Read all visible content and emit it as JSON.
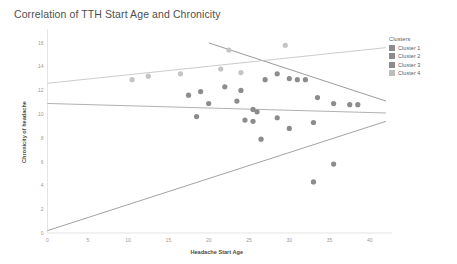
{
  "chart_data": {
    "type": "scatter",
    "title": "Correlation of TTH Start Age and Chronicity",
    "xlabel": "Headache Start Age",
    "ylabel": "Chronicity of headache",
    "xlim": [
      0,
      42
    ],
    "ylim": [
      0,
      17
    ],
    "xticks": [
      0,
      5,
      10,
      15,
      20,
      25,
      30,
      35,
      40
    ],
    "yticks": [
      0,
      2,
      4,
      6,
      8,
      10,
      12,
      14,
      16
    ],
    "grid": false,
    "legend": {
      "title": "Clusters",
      "position": "right",
      "entries": [
        {
          "label": "Cluster 1",
          "color": "#8c8c8c"
        },
        {
          "label": "Cluster 2",
          "color": "#8c8c8c"
        },
        {
          "label": "Cluster 3",
          "color": "#8c8c8c"
        },
        {
          "label": "Cluster 4",
          "color": "#bdbdbd"
        }
      ]
    },
    "series": [
      {
        "name": "Cluster 1",
        "color": "#8c8c8c",
        "points": [
          [
            17.5,
            11.6
          ],
          [
            19.0,
            11.9
          ],
          [
            20.0,
            10.9
          ],
          [
            22.0,
            12.3
          ],
          [
            23.5,
            11.1
          ],
          [
            24.0,
            12.0
          ],
          [
            25.5,
            10.4
          ],
          [
            26.0,
            10.2
          ],
          [
            27.0,
            12.9
          ],
          [
            28.5,
            13.4
          ],
          [
            30.0,
            13.0
          ],
          [
            31.0,
            12.9
          ],
          [
            32.0,
            12.9
          ],
          [
            33.5,
            11.4
          ],
          [
            35.5,
            10.9
          ],
          [
            37.5,
            10.8
          ],
          [
            38.5,
            10.8
          ]
        ]
      },
      {
        "name": "Cluster 2",
        "color": "#8c8c8c",
        "points": [
          [
            18.5,
            9.8
          ],
          [
            24.5,
            9.5
          ],
          [
            25.5,
            9.4
          ],
          [
            28.5,
            9.7
          ],
          [
            30.0,
            8.8
          ],
          [
            33.0,
            9.3
          ],
          [
            26.5,
            7.9
          ]
        ]
      },
      {
        "name": "Cluster 3",
        "color": "#8c8c8c",
        "points": [
          [
            33.0,
            4.3
          ],
          [
            35.5,
            5.8
          ]
        ]
      },
      {
        "name": "Cluster 4",
        "color": "#c4c4c4",
        "points": [
          [
            10.5,
            12.9
          ],
          [
            12.5,
            13.2
          ],
          [
            16.5,
            13.4
          ],
          [
            21.5,
            13.8
          ],
          [
            22.5,
            15.4
          ],
          [
            24.0,
            13.5
          ],
          [
            29.5,
            15.8
          ]
        ]
      }
    ],
    "trendlines": [
      {
        "name": "Cluster 1 trend",
        "color": "#6f6f6f",
        "x0": 20.0,
        "y0": 16.0,
        "x1": 42.0,
        "y1": 11.1
      },
      {
        "name": "Cluster 2 trend",
        "color": "#8f8f8f",
        "x0": 0.0,
        "y0": 10.9,
        "x1": 42.0,
        "y1": 10.1
      },
      {
        "name": "Cluster 3 trend",
        "color": "#7a7a7a",
        "x0": 0.0,
        "y0": 0.2,
        "x1": 42.0,
        "y1": 9.4
      },
      {
        "name": "Cluster 4 trend",
        "color": "#b5b5b5",
        "x0": 0.0,
        "y0": 12.6,
        "x1": 42.0,
        "y1": 15.6
      }
    ]
  }
}
